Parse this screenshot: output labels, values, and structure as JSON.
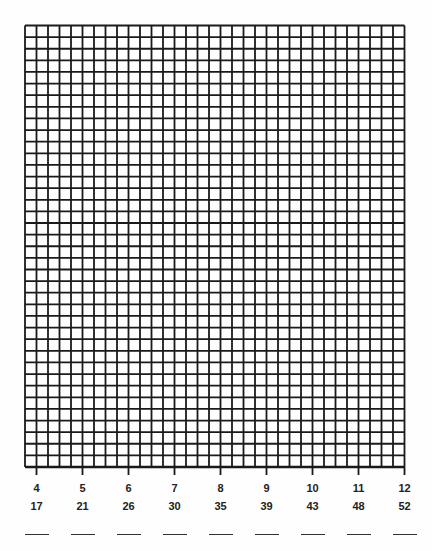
{
  "worksheet": {
    "grid": {
      "columns": 33,
      "rows": 38,
      "line_color": "#1a1a1a",
      "background": "#fefefe"
    },
    "axis_ticks": [
      {
        "top": "4",
        "bottom": "17"
      },
      {
        "top": "5",
        "bottom": "21"
      },
      {
        "top": "6",
        "bottom": "26"
      },
      {
        "top": "7",
        "bottom": "30"
      },
      {
        "top": "8",
        "bottom": "35"
      },
      {
        "top": "9",
        "bottom": "39"
      },
      {
        "top": "10",
        "bottom": "43"
      },
      {
        "top": "11",
        "bottom": "48"
      },
      {
        "top": "12",
        "bottom": "52"
      }
    ],
    "answer_blanks": 9
  }
}
